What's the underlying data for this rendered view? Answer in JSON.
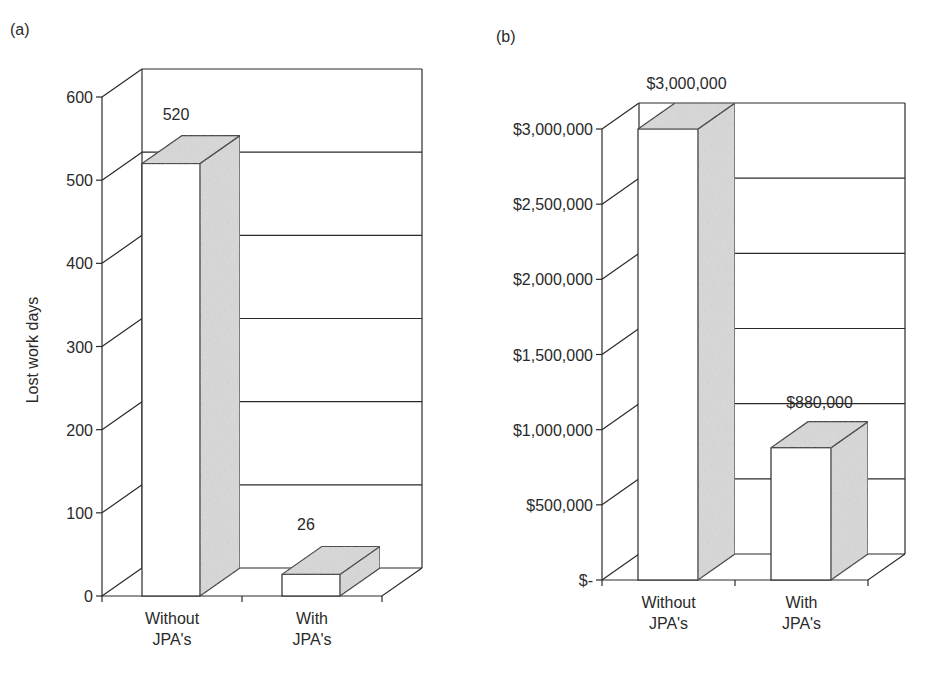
{
  "panels": [
    {
      "label": "(a)"
    },
    {
      "label": "(b)"
    }
  ],
  "colors": {
    "line": "#2a2a2a",
    "bar_front": "#ffffff",
    "bar_side": "#d9d9d9",
    "background": "#ffffff"
  },
  "chart_data": [
    {
      "type": "bar",
      "style": "3d",
      "panel": "(a)",
      "title": "",
      "categories": [
        "Without JPA's",
        "With JPA's"
      ],
      "category_lines": [
        [
          "Without",
          "JPA's"
        ],
        [
          "With",
          "JPA's"
        ]
      ],
      "values": [
        520,
        26
      ],
      "data_labels": [
        "520",
        "26"
      ],
      "xlabel": "",
      "ylabel": "Lost work days",
      "ylim": [
        0,
        600
      ],
      "yticks": [
        0,
        100,
        200,
        300,
        400,
        500,
        600
      ],
      "ytick_labels": [
        "0",
        "100",
        "200",
        "300",
        "400",
        "500",
        "600"
      ],
      "grid": true,
      "legend": null
    },
    {
      "type": "bar",
      "style": "3d",
      "panel": "(b)",
      "title": "",
      "categories": [
        "Without JPA's",
        "With JPA's"
      ],
      "category_lines": [
        [
          "Without",
          "JPA's"
        ],
        [
          "With",
          "JPA's"
        ]
      ],
      "values": [
        3000000,
        880000
      ],
      "data_labels": [
        "$3,000,000",
        "$880,000"
      ],
      "xlabel": "",
      "ylabel": "",
      "ylim": [
        0,
        3000000
      ],
      "yticks": [
        0,
        500000,
        1000000,
        1500000,
        2000000,
        2500000,
        3000000
      ],
      "ytick_labels": [
        "$-",
        "$500,000",
        "$1,000,000",
        "$1,500,000",
        "$2,000,000",
        "$2,500,000",
        "$3,000,000"
      ],
      "grid": true,
      "legend": null
    }
  ]
}
